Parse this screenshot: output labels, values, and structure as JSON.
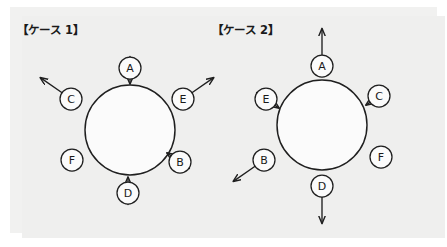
{
  "page": {
    "background_color": "#ffffff",
    "panel_color": "#f1f1f0",
    "ink_color": "#1f1f1f"
  },
  "cases": [
    {
      "id": "case1",
      "title": "【ケース 1】",
      "center": {
        "x": 130,
        "y": 130
      },
      "radius": 45,
      "nodes": [
        {
          "label": "A",
          "position": "top",
          "cx": 130,
          "cy": 68,
          "r": 11,
          "arrow": "inward",
          "direction": "down",
          "has_arrow": true
        },
        {
          "label": "C",
          "position": "upper-left",
          "cx": 71,
          "cy": 99,
          "r": 11,
          "arrow": "outward",
          "direction": "up-left",
          "has_arrow": true
        },
        {
          "label": "E",
          "position": "upper-right",
          "cx": 183,
          "cy": 99,
          "r": 11,
          "arrow": "outward",
          "direction": "up-right",
          "has_arrow": true
        },
        {
          "label": "B",
          "position": "lower-right",
          "cx": 180,
          "cy": 162,
          "r": 11,
          "arrow": "inward",
          "direction": "up-left",
          "has_arrow": true
        },
        {
          "label": "F",
          "position": "lower-left",
          "cx": 72,
          "cy": 160,
          "r": 11,
          "arrow": "none",
          "direction": "none",
          "has_arrow": false
        },
        {
          "label": "D",
          "position": "bottom",
          "cx": 128,
          "cy": 193,
          "r": 11,
          "arrow": "inward",
          "direction": "up",
          "has_arrow": true
        }
      ]
    },
    {
      "id": "case2",
      "title": "【ケース 2】",
      "center": {
        "x": 322,
        "y": 125
      },
      "radius": 45,
      "nodes": [
        {
          "label": "A",
          "position": "top",
          "cx": 322,
          "cy": 66,
          "r": 11,
          "arrow": "outward",
          "direction": "up",
          "has_arrow": true
        },
        {
          "label": "E",
          "position": "upper-left",
          "cx": 266,
          "cy": 99,
          "r": 11,
          "arrow": "inward",
          "direction": "down-right",
          "has_arrow": true
        },
        {
          "label": "C",
          "position": "upper-right",
          "cx": 379,
          "cy": 96,
          "r": 11,
          "arrow": "inward",
          "direction": "down-left",
          "has_arrow": true
        },
        {
          "label": "B",
          "position": "lower-left",
          "cx": 264,
          "cy": 160,
          "r": 11,
          "arrow": "outward",
          "direction": "down-left",
          "has_arrow": true
        },
        {
          "label": "F",
          "position": "lower-right",
          "cx": 381,
          "cy": 157,
          "r": 11,
          "arrow": "none",
          "direction": "none",
          "has_arrow": false
        },
        {
          "label": "D",
          "position": "bottom",
          "cx": 322,
          "cy": 186,
          "r": 11,
          "arrow": "outward",
          "direction": "down",
          "has_arrow": true
        }
      ]
    }
  ]
}
